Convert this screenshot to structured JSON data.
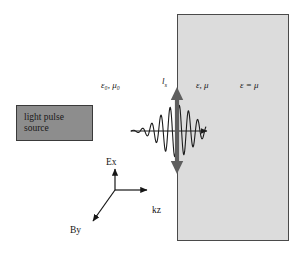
{
  "figure": {
    "background_color": "#ffffff"
  },
  "slab": {
    "name": "dielectric-medium-slab",
    "fill_color": "#dcdcdc",
    "border_color": "#4a4a4a",
    "x": 177,
    "y": 14,
    "width": 112,
    "height": 227
  },
  "source": {
    "line1": "light pulse",
    "line2": "source",
    "fill_color": "#8d8d8d",
    "border_color": "#3a3a3a",
    "x": 16,
    "y": 105,
    "width": 77,
    "height": 36
  },
  "labels": {
    "vacuum": "ε₀, μ₀",
    "interface_length": "l",
    "interface_length_sub": "s",
    "medium": "ε, μ",
    "impedance_match": "ε = μ"
  },
  "axes": {
    "e_field": "Ex",
    "b_field": "By",
    "wavevector": "kz",
    "origin_x": 115,
    "origin_y": 190
  },
  "wave": {
    "name": "gaussian-wave-packet",
    "propagation_axis_y": 131,
    "start_x": 131,
    "arrow_tip_x": 214,
    "envelope_center_x": 177,
    "envelope_width": 23,
    "amplitude": 26,
    "wavelength": 9.2,
    "stroke_color": "#1c1c1c"
  },
  "interface_arrow": {
    "name": "field-oscillation-double-arrow",
    "x": 177,
    "top_y": 88,
    "bottom_y": 173,
    "color": "#5f5f5f"
  },
  "chart_data": {
    "type": "line",
    "xlabel": "kz",
    "ylabel": "Ex",
    "annotations": [
      "ε₀, μ₀",
      "l_s",
      "ε, μ",
      "ε = μ",
      "light pulse source"
    ],
    "grid": false,
    "legend": "none"
  }
}
